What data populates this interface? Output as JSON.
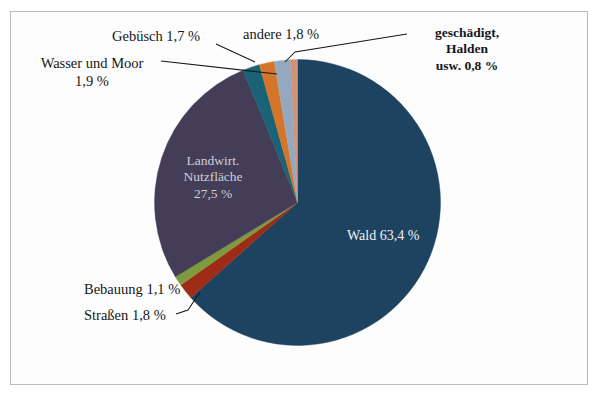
{
  "figure": {
    "border_color": "#b9bcbe",
    "background": "#ffffff"
  },
  "chart_data": {
    "type": "pie",
    "title": "",
    "subtitle": "",
    "xlabel": "",
    "ylabel": "",
    "legend_position": "none (direct labels with leader lines)",
    "grid": false,
    "unit": "%",
    "total": 100.0,
    "start_angle_deg": 0,
    "direction": "clockwise",
    "categories": [
      "Wald",
      "Straßen",
      "Bebauung",
      "Landwirt. Nutzfläche",
      "Wasser und Moor",
      "Gebüsch",
      "andere",
      "geschädigt, Halden usw."
    ],
    "values": [
      63.4,
      1.8,
      1.1,
      27.5,
      1.9,
      1.7,
      1.8,
      0.8
    ],
    "colors": [
      "#1d4360",
      "#9d2b15",
      "#7f993f",
      "#433d58",
      "#1a6377",
      "#d4752a",
      "#94a8c0",
      "#cf9377"
    ],
    "slices": [
      {
        "label": "Wald",
        "value": 63.4,
        "value_text": "63,4 %",
        "color": "#1d4360"
      },
      {
        "label": "Straßen",
        "value": 1.8,
        "value_text": "1,8 %",
        "color": "#9d2b15"
      },
      {
        "label": "Bebauung",
        "value": 1.1,
        "value_text": "1,1 %",
        "color": "#7f993f"
      },
      {
        "label": "Landwirt. Nutzfläche",
        "value": 27.5,
        "value_text": "27,5 %",
        "color": "#433d58"
      },
      {
        "label": "Wasser und Moor",
        "value": 1.9,
        "value_text": "1,9 %",
        "color": "#1a6377"
      },
      {
        "label": "Gebüsch",
        "value": 1.7,
        "value_text": "1,7 %",
        "color": "#d4752a"
      },
      {
        "label": "andere",
        "value": 1.8,
        "value_text": "1,8 %",
        "color": "#94a8c0"
      },
      {
        "label": "geschädigt, Halden usw.",
        "value": 0.8,
        "value_text": "0,8 %",
        "color": "#cf9377"
      }
    ]
  },
  "labels": {
    "gebuesch": "Gebüsch 1,7 %",
    "andere": "andere 1,8 %",
    "geschaedigt_line1": "geschädigt,",
    "geschaedigt_line2": "Halden",
    "geschaedigt_line3": "usw. 0,8 %",
    "wasser_line1": "Wasser und Moor",
    "wasser_line2": "1,9 %",
    "landwirt_line1": "Landwirt.",
    "landwirt_line2": "Nutzfläche",
    "landwirt_line3": "27,5 %",
    "wald": "Wald 63,4 %",
    "bebauung": "Bebauung 1,1 %",
    "strassen": "Straßen 1,8 %"
  }
}
